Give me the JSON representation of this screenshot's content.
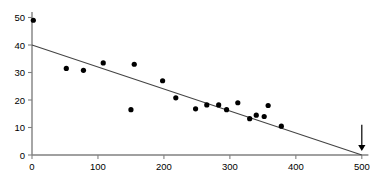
{
  "chart_data": {
    "type": "scatter",
    "title": "",
    "xlabel": "",
    "ylabel": "",
    "xlim": [
      0,
      520
    ],
    "ylim": [
      0,
      52
    ],
    "grid": false,
    "legend": null,
    "xticks": [
      0,
      100,
      200,
      300,
      400,
      500
    ],
    "yticks": [
      0,
      10,
      20,
      30,
      40,
      50
    ],
    "xtick_labels": [
      "0",
      "100",
      "200",
      "300",
      "400",
      "500"
    ],
    "ytick_labels": [
      "0",
      "10",
      "20",
      "30",
      "40",
      "50"
    ],
    "series": [
      {
        "name": "observations",
        "marker": "filled-circle",
        "color": "#000000",
        "points": [
          {
            "x": 2,
            "y": 49.0
          },
          {
            "x": 52,
            "y": 31.5
          },
          {
            "x": 78,
            "y": 30.8
          },
          {
            "x": 108,
            "y": 33.5
          },
          {
            "x": 150,
            "y": 16.5
          },
          {
            "x": 155,
            "y": 33.0
          },
          {
            "x": 198,
            "y": 27.0
          },
          {
            "x": 218,
            "y": 20.8
          },
          {
            "x": 248,
            "y": 16.8
          },
          {
            "x": 265,
            "y": 18.2
          },
          {
            "x": 283,
            "y": 18.2
          },
          {
            "x": 295,
            "y": 16.5
          },
          {
            "x": 312,
            "y": 19.0
          },
          {
            "x": 330,
            "y": 13.2
          },
          {
            "x": 340,
            "y": 14.5
          },
          {
            "x": 352,
            "y": 14.0
          },
          {
            "x": 358,
            "y": 18.0
          },
          {
            "x": 378,
            "y": 10.5
          }
        ]
      }
    ],
    "fit_line": {
      "name": "regression-line",
      "color": "#444444",
      "intercept": 40,
      "slope": -0.08,
      "x_start": 0,
      "y_start": 40,
      "x_end": 500,
      "y_end": 0
    },
    "annotations": [
      {
        "name": "down-arrow",
        "type": "arrow",
        "direction": "down",
        "x": 500,
        "y_from": 11,
        "y_to": 1.5,
        "color": "#000000"
      }
    ]
  }
}
